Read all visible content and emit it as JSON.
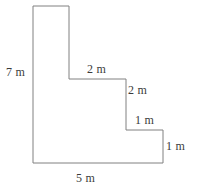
{
  "figure": {
    "kind": "staircase-polygon-dimension-diagram",
    "stroke_color": "#808080",
    "fill_color": "#ffffff",
    "background_color": "#ffffff",
    "stroke_width": 1,
    "unit": "m",
    "outline_points": "33,6 69,6 69,79 126,79 126,130 163,130 163,163 33,163",
    "labels": {
      "left_height": "7 m",
      "step1_top": "2 m",
      "step1_side": "2 m",
      "step2_top": "1 m",
      "step2_side": "1 m",
      "bottom_width": "5 m"
    }
  },
  "chart_data": {
    "type": "diagram",
    "title": "",
    "shape": "L-shaped staircase polygon",
    "unit": "m",
    "labeled_edges": [
      {
        "name": "left-height",
        "value": 7,
        "text": "7 m",
        "orientation": "vertical",
        "position": "left"
      },
      {
        "name": "step1-top",
        "value": 2,
        "text": "2 m",
        "orientation": "horizontal",
        "position": "top-step-1"
      },
      {
        "name": "step1-side",
        "value": 2,
        "text": "2 m",
        "orientation": "vertical",
        "position": "right-step-1"
      },
      {
        "name": "step2-top",
        "value": 1,
        "text": "1 m",
        "orientation": "horizontal",
        "position": "top-step-2"
      },
      {
        "name": "step2-side",
        "value": 1,
        "text": "1 m",
        "orientation": "vertical",
        "position": "right-step-2"
      },
      {
        "name": "bottom-width",
        "value": 5,
        "text": "5 m",
        "orientation": "horizontal",
        "position": "bottom"
      }
    ],
    "vertices": [
      [
        0,
        7
      ],
      [
        2,
        7
      ],
      [
        2,
        4
      ],
      [
        4,
        4
      ],
      [
        4,
        2
      ],
      [
        5,
        2
      ],
      [
        5,
        0
      ],
      [
        0,
        0
      ]
    ]
  }
}
